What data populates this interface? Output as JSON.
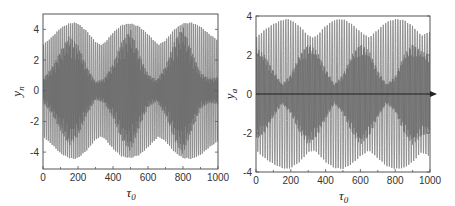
{
  "chart_data": [
    {
      "type": "line",
      "title": "",
      "xlabel": "τ0",
      "xlabel_main": "τ",
      "xlabel_sub": "0",
      "ylabel": "y_n",
      "ylabel_main": "y",
      "ylabel_sub": "n",
      "xlim": [
        0,
        1000
      ],
      "ylim": [
        -5.1,
        5.0
      ],
      "xticks": [
        0,
        200,
        400,
        600,
        800,
        1000
      ],
      "xtick_labels": [
        "0",
        "200",
        "400",
        "600",
        "800",
        "1000"
      ],
      "yticks": [
        4,
        2,
        0,
        -2,
        -4
      ],
      "ytick_labels": [
        "4",
        "2",
        "0",
        "-2",
        "-4"
      ],
      "grid": false,
      "legend": null,
      "description": "Rapid oscillation with slowly modulated envelope; outer envelope between ~3.0 and ~4.4, inner dense core beating with period ~330",
      "series": [
        {
          "name": "y_n",
          "color": "#777777",
          "carrier_period": 11,
          "envelope_x": [
            0,
            50,
            100,
            150,
            180,
            200,
            250,
            300,
            330,
            350,
            400,
            450,
            500,
            550,
            600,
            650,
            660,
            700,
            750,
            800,
            850,
            900,
            950,
            1000
          ],
          "outer_envelope": [
            3.0,
            3.5,
            4.1,
            4.4,
            4.45,
            4.4,
            3.9,
            3.2,
            3.0,
            3.1,
            3.8,
            4.3,
            4.4,
            4.2,
            3.7,
            3.1,
            3.0,
            3.3,
            4.0,
            4.4,
            4.45,
            4.2,
            3.7,
            3.3
          ],
          "inner_envelope_x": [
            0,
            50,
            100,
            150,
            200,
            250,
            300,
            350,
            400,
            450,
            500,
            550,
            600,
            650,
            700,
            750,
            800,
            850,
            900,
            950,
            1000
          ],
          "inner_envelope": [
            0.8,
            1.5,
            2.6,
            3.6,
            3.0,
            1.6,
            0.6,
            0.8,
            1.8,
            3.2,
            4.0,
            2.4,
            1.1,
            0.7,
            1.6,
            3.2,
            4.2,
            2.6,
            1.2,
            0.8,
            0.9
          ]
        }
      ]
    },
    {
      "type": "line",
      "title": "",
      "xlabel": "τ0",
      "xlabel_main": "τ",
      "xlabel_sub": "0",
      "ylabel": "y_a",
      "ylabel_main": "y",
      "ylabel_sub": "a",
      "xlim": [
        0,
        1000
      ],
      "ylim": [
        -4,
        4
      ],
      "xticks": [
        0,
        200,
        400,
        600,
        800,
        1000
      ],
      "xtick_labels": [
        "0",
        "200",
        "400",
        "600",
        "800",
        "1000"
      ],
      "yticks": [
        4,
        2,
        0,
        -2,
        -4
      ],
      "ytick_labels": [
        "4",
        "2",
        "0",
        "-2",
        "-4"
      ],
      "grid": false,
      "legend": null,
      "zero_line_arrow": true,
      "description": "Rapid oscillation with slowly modulated envelope between ~2.9 and ~3.85, beat period ~320",
      "series": [
        {
          "name": "y_a",
          "color": "#808080",
          "carrier_period": 14,
          "envelope_x": [
            0,
            50,
            100,
            150,
            180,
            200,
            250,
            300,
            330,
            350,
            400,
            450,
            500,
            550,
            600,
            650,
            700,
            750,
            800,
            850,
            900,
            950,
            1000
          ],
          "outer_envelope": [
            2.9,
            3.3,
            3.6,
            3.8,
            3.85,
            3.8,
            3.5,
            3.0,
            2.9,
            3.0,
            3.5,
            3.8,
            3.85,
            3.6,
            3.2,
            2.9,
            3.3,
            3.7,
            3.85,
            3.8,
            3.5,
            3.0,
            3.2
          ],
          "inner_envelope_x": [
            0,
            50,
            100,
            150,
            200,
            250,
            300,
            350,
            400,
            450,
            500,
            550,
            600,
            650,
            700,
            750,
            800,
            850,
            900,
            950,
            1000
          ],
          "inner_envelope": [
            2.4,
            2.0,
            1.2,
            0.5,
            1.0,
            2.0,
            2.6,
            2.2,
            1.3,
            0.5,
            1.0,
            2.0,
            2.6,
            2.2,
            1.2,
            0.5,
            0.9,
            2.0,
            2.6,
            2.2,
            2.0
          ]
        }
      ]
    }
  ],
  "panels": [
    {
      "frame": {
        "left": 43,
        "top": 14,
        "right": 218,
        "bottom": 169
      }
    },
    {
      "frame": {
        "left": 256,
        "top": 16,
        "right": 430,
        "bottom": 172
      }
    }
  ],
  "colors": {
    "frame": "#555555",
    "zero_line": "#222222"
  }
}
